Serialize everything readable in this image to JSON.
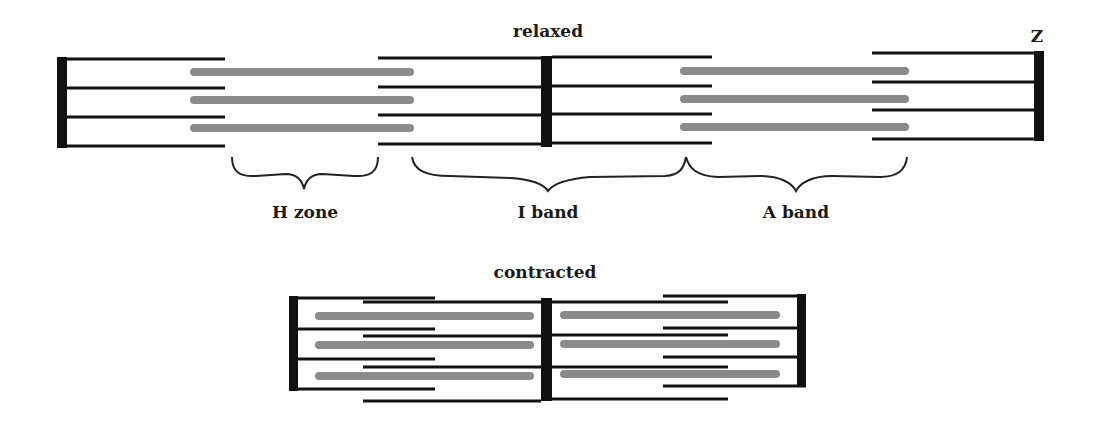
{
  "diagram": {
    "relaxed": {
      "title": "relaxed",
      "z_label": "Z",
      "labels": {
        "h_zone": "H zone",
        "i_band": "I band",
        "a_band": "A band"
      }
    },
    "contracted": {
      "title": "contracted"
    },
    "colors": {
      "actin": "#111111",
      "myosin": "#8a8a8a",
      "z_disc": "#111111",
      "background": "#ffffff"
    }
  }
}
